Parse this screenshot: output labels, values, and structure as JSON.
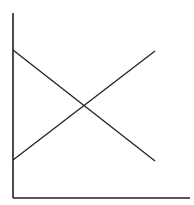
{
  "diagram": {
    "type": "line-crossing",
    "colors": {
      "background": "#ffffff",
      "stroke": "#222222"
    },
    "axes": {
      "y_axis": {
        "x": 13,
        "y1": 13,
        "y2": 198
      },
      "x_axis": {
        "y": 198,
        "x1": 13,
        "x2": 190
      }
    },
    "lines": [
      {
        "name": "descending",
        "x1": 13,
        "y1": 50,
        "x2": 155,
        "y2": 161
      },
      {
        "name": "ascending",
        "x1": 13,
        "y1": 160,
        "x2": 155,
        "y2": 51
      }
    ],
    "intersection": {
      "x": 85,
      "y": 106
    }
  }
}
